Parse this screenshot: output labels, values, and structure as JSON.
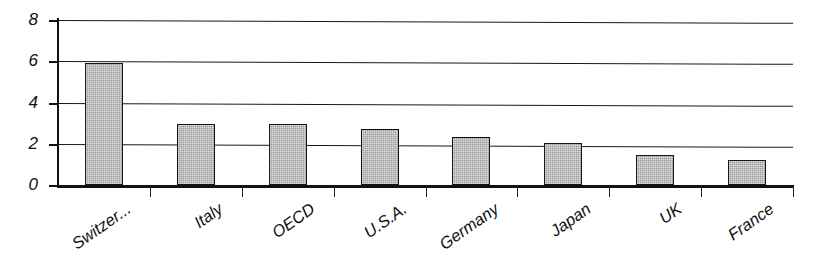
{
  "chart_data": {
    "type": "bar",
    "title": "",
    "subtitle": "",
    "xlabel": "",
    "ylabel": "",
    "categories": [
      "Switzer...",
      "Italy",
      "OECD",
      "U.S.A.",
      "Germany",
      "Japan",
      "UK",
      "France"
    ],
    "values": [
      5.9,
      2.95,
      2.95,
      2.7,
      2.35,
      2.05,
      1.45,
      1.2
    ],
    "ylim": [
      0,
      8
    ],
    "yticks": [
      0,
      2,
      4,
      6,
      8
    ],
    "ytick_labels": [
      "0",
      "2",
      "4",
      "6",
      "8"
    ],
    "grid": true,
    "grid_axis": "y",
    "legend": false,
    "legend_position": "none",
    "bar_fill_color": "#9a9a9a",
    "bar_edge_color": "#161616",
    "axis_color": "#111111",
    "background_color": "#ffffff",
    "label_rotation_degrees": -35
  }
}
